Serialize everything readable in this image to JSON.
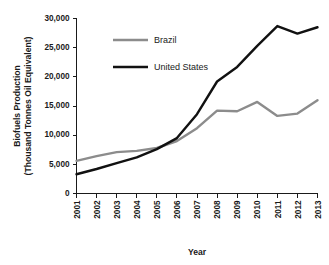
{
  "chart_data": {
    "type": "line",
    "title": "",
    "xlabel": "Year",
    "ylabel": "Biofuels Production (Thousand Tonnes Oil Equivalent)",
    "ylabel_line1": "Biofuels Production",
    "ylabel_line2": "(Thousand Tonnes Oil Equivalent)",
    "categories": [
      "2001",
      "2002",
      "2003",
      "2004",
      "2005",
      "2006",
      "2007",
      "2008",
      "2009",
      "2010",
      "2011",
      "2012",
      "2013"
    ],
    "x": [
      2001,
      2002,
      2003,
      2004,
      2005,
      2006,
      2007,
      2008,
      2009,
      2010,
      2011,
      2012,
      2013
    ],
    "series": [
      {
        "name": "Brazil",
        "color": "#8c8c8c",
        "values": [
          5600,
          6400,
          7100,
          7300,
          7800,
          9000,
          11200,
          14200,
          14100,
          15700,
          13300,
          13700,
          16000
        ]
      },
      {
        "name": "United States",
        "color": "#111111",
        "values": [
          3300,
          4200,
          5200,
          6200,
          7600,
          9500,
          13600,
          19200,
          21700,
          25300,
          28700,
          27400,
          28500
        ]
      }
    ],
    "ylim": [
      0,
      30000
    ],
    "xlim": [
      2001,
      2013
    ],
    "ytick_values": [
      0,
      5000,
      10000,
      15000,
      20000,
      25000,
      30000
    ],
    "ytick_labels": [
      "0",
      "5,000",
      "10,000",
      "15,000",
      "20,000",
      "25,000",
      "30,000"
    ],
    "grid": false,
    "legend_position": "upper-left-inside",
    "legend_entries": [
      "Brazil",
      "United States"
    ]
  }
}
